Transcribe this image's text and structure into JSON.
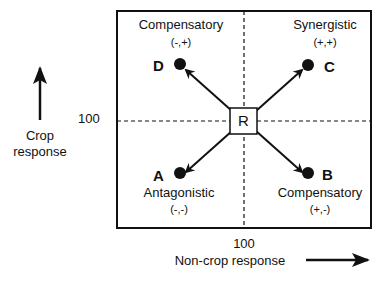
{
  "axes": {
    "y_label_line1": "Crop",
    "y_label_line2": "response",
    "y_ref": "100",
    "x_label": "Non-crop response",
    "x_ref": "100"
  },
  "center": {
    "label": "R"
  },
  "points": [
    {
      "id": "D",
      "quadrant": "top-left",
      "name": "Compensatory",
      "signs": "(-,+)"
    },
    {
      "id": "C",
      "quadrant": "top-right",
      "name": "Synergistic",
      "signs": "(+,+)"
    },
    {
      "id": "A",
      "quadrant": "bottom-left",
      "name": "Antagonistic",
      "signs": "(-,-)"
    },
    {
      "id": "B",
      "quadrant": "bottom-right",
      "name": "Compensatory",
      "signs": "(+,-)"
    }
  ]
}
